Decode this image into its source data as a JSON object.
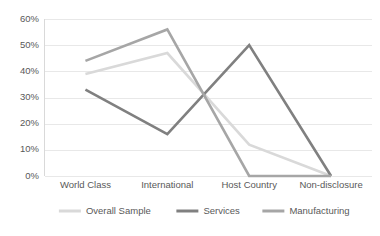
{
  "chart_data": {
    "type": "line",
    "title": "",
    "subtitle": "",
    "xlabel": "",
    "ylabel": "",
    "categories": [
      "World Class",
      "International",
      "Host Country",
      "Non-disclosure"
    ],
    "series": [
      {
        "name": "Overall Sample",
        "values": [
          39,
          47,
          12,
          0
        ],
        "color": "#d9d9d9"
      },
      {
        "name": "Services",
        "values": [
          33,
          16,
          50,
          0
        ],
        "color": "#808080"
      },
      {
        "name": "Manufacturing",
        "values": [
          44,
          56,
          0,
          0
        ],
        "color": "#a6a6a6"
      }
    ],
    "ylim": [
      0,
      60
    ],
    "ytick_values": [
      0,
      10,
      20,
      30,
      40,
      50,
      60
    ],
    "ytick_labels": [
      "0%",
      "10%",
      "20%",
      "30%",
      "40%",
      "50%",
      "60%"
    ],
    "grid": true,
    "grid_axis": "y",
    "legend_position": "bottom",
    "markers": false
  },
  "axes": {
    "y_ticks": [
      {
        "label": "60%",
        "value": 60
      },
      {
        "label": "50%",
        "value": 50
      },
      {
        "label": "40%",
        "value": 40
      },
      {
        "label": "30%",
        "value": 30
      },
      {
        "label": "20%",
        "value": 20
      },
      {
        "label": "10%",
        "value": 10
      },
      {
        "label": "0%",
        "value": 0
      }
    ],
    "x_categories": [
      {
        "label": "World Class"
      },
      {
        "label": "International"
      },
      {
        "label": "Host Country"
      },
      {
        "label": "Non-disclosure"
      }
    ]
  },
  "legend": {
    "entries": [
      {
        "label": "Overall Sample",
        "color": "#d9d9d9"
      },
      {
        "label": "Services",
        "color": "#808080"
      },
      {
        "label": "Manufacturing",
        "color": "#a6a6a6"
      }
    ]
  },
  "colors": {
    "overall_sample": "#d9d9d9",
    "services": "#808080",
    "manufacturing": "#a6a6a6",
    "gridline": "#e8e8e8",
    "axis": "#d9d9d9",
    "text": "#595959",
    "background": "#ffffff"
  }
}
